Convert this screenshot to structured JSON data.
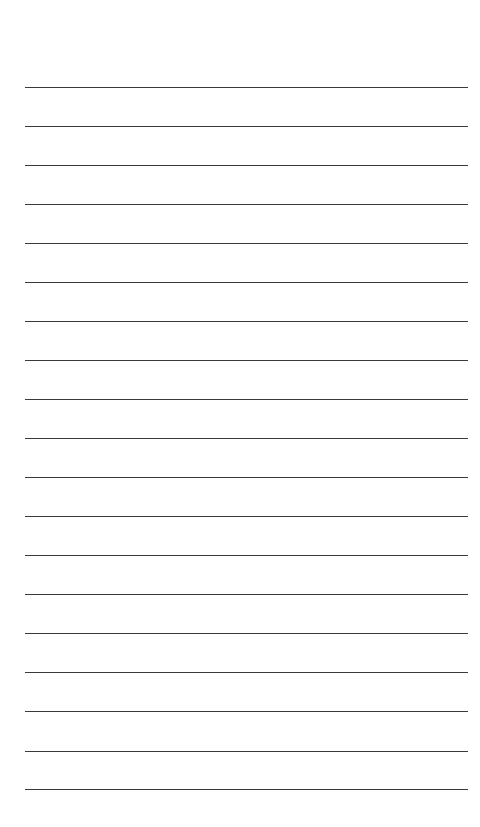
{
  "page": {
    "type": "blank-lined-sheet",
    "background": "#ffffff",
    "rule_color": "#3a3a3a",
    "rule_count": 19,
    "rule_positions_y": [
      87,
      126,
      165,
      204,
      243,
      282,
      321,
      360,
      399,
      438,
      477,
      516,
      555,
      594,
      633,
      672,
      711,
      751,
      789
    ],
    "rule_x_start": 25,
    "rule_x_end": 468
  }
}
